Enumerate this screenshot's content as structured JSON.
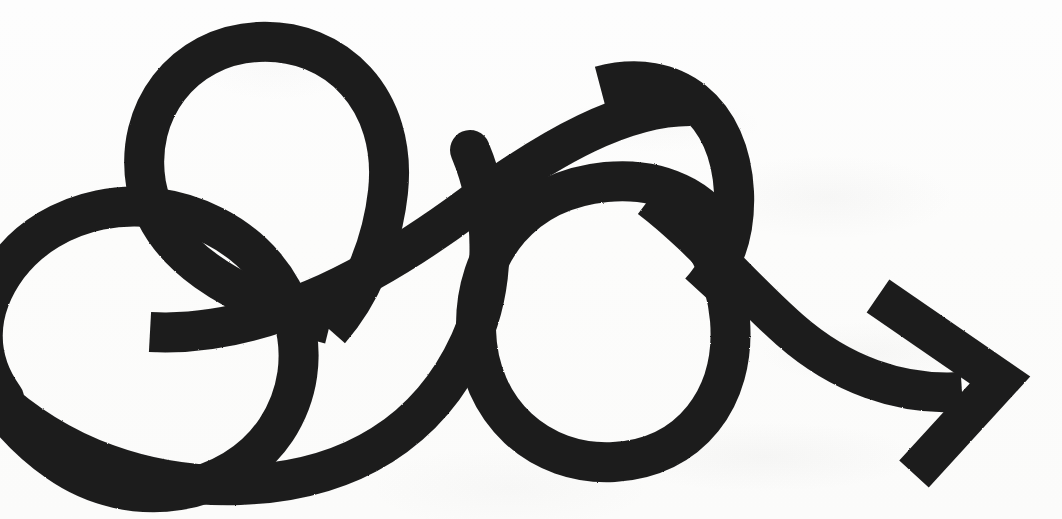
{
  "artwork": {
    "title": "Looping squiggle arrow",
    "subject": "hand-drawn bold black arrow that loops twice and points to the lower right",
    "medium": "thick marker stroke on off-white paper",
    "canvas": {
      "width": 1062,
      "height": 519
    },
    "colors": {
      "ink": "#1d1d1d",
      "paper": "#fdfdfc",
      "paper_shadow": "#f3f3f1"
    },
    "stroke": {
      "width": 40,
      "linecap": "butt",
      "linejoin": "round"
    },
    "features": [
      {
        "name": "upper-left-loop",
        "label": "Upper left loop",
        "center_x": 262,
        "center_y": 152,
        "radius": 112
      },
      {
        "name": "lower-left-loop",
        "label": "Lower left loop",
        "center_x": 85,
        "center_y": 352,
        "radius": 118
      },
      {
        "name": "right-loop",
        "label": "Right circular loop",
        "center_x": 600,
        "center_y": 335,
        "radius": 122
      },
      {
        "name": "rising-diagonal",
        "label": "Rising diagonal connector",
        "from_x": 340,
        "from_y": 228,
        "to_x": 700,
        "to_y": 175
      },
      {
        "name": "arrow-head",
        "label": "Chevron arrow head",
        "tip_x": 993,
        "tip_y": 378
      }
    ],
    "path_d": "M -70 262 C -70 180, 60 172, 138 212 C 230 260, 300 330, 300 330 C 330 300, 360 246, 372 190 C 392 96, 318 34, 248 44 C 178 54, 134 122, 150 186 C 166 252, 238 296, 330 320 C 470 358, 620 300, 700 188 C 745 126, 722 60, 690 44",
    "arrow_head_points": "886,300 993,378 912,470",
    "labels": {
      "stroke_color_name": "black ink",
      "background_color_name": "off-white paper"
    }
  }
}
